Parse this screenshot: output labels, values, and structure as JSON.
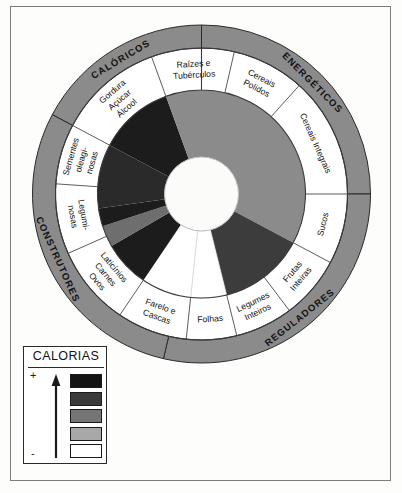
{
  "figure": {
    "center_hole": "empty",
    "outer_ring_color": "#8b8b8b",
    "label_ring_color": "#ffffff",
    "outline_color": "#1a1a1a"
  },
  "categories": [
    {
      "name": "CALORICOS",
      "label": "CALÓRICOS",
      "start_deg": -62,
      "end_deg": 0
    },
    {
      "name": "ENERGETICOS",
      "label": "ENERGÉTICOS",
      "start_deg": 0,
      "end_deg": 90
    },
    {
      "name": "REGULADORES",
      "label": "REGULADORES",
      "start_deg": 90,
      "end_deg": 193
    },
    {
      "name": "CONSTRUTORES",
      "label": "CONSTRUTORES",
      "start_deg": 193,
      "end_deg": 298
    }
  ],
  "food_groups": [
    {
      "name": "gordura-acucar-alcool",
      "lines": [
        "Gordura",
        "Açúcar",
        "Álcool"
      ],
      "start_deg": -62,
      "end_deg": -20
    },
    {
      "name": "raizes-e-tuberculos",
      "lines": [
        "Raízes e",
        "Tubérculos"
      ],
      "start_deg": -20,
      "end_deg": 13
    },
    {
      "name": "cereais-polidos",
      "lines": [
        "Cereais",
        "Polidos"
      ],
      "start_deg": 13,
      "end_deg": 42
    },
    {
      "name": "cereais-integrais",
      "lines": [
        "Cereais Integrais"
      ],
      "start_deg": 42,
      "end_deg": 90
    },
    {
      "name": "sucos",
      "lines": [
        "Sucos"
      ],
      "start_deg": 90,
      "end_deg": 118
    },
    {
      "name": "frutas-inteiras",
      "lines": [
        "Frutas",
        "Inteiras"
      ],
      "start_deg": 118,
      "end_deg": 143
    },
    {
      "name": "legumes-inteiros",
      "lines": [
        "Legumes",
        "Inteiros"
      ],
      "start_deg": 143,
      "end_deg": 166
    },
    {
      "name": "folhas",
      "lines": [
        "Folhas"
      ],
      "start_deg": 166,
      "end_deg": 186
    },
    {
      "name": "farelo-e-cascas",
      "lines": [
        "Farelo e",
        "Cascas"
      ],
      "start_deg": 186,
      "end_deg": 214
    },
    {
      "name": "laticinios-carnes-ovos",
      "lines": [
        "Laticínios",
        "Carnes",
        "Ovos"
      ],
      "start_deg": 214,
      "end_deg": 246
    },
    {
      "name": "leguminosas",
      "lines": [
        "Legumi-",
        "nosas"
      ],
      "start_deg": 246,
      "end_deg": 274
    },
    {
      "name": "sementes-oleaginosas",
      "lines": [
        "Sementes",
        "oleagi-",
        "nosas"
      ],
      "start_deg": 274,
      "end_deg": 298
    }
  ],
  "calorie_segments": [
    {
      "name": "seg-gordura-acucar-alcool",
      "start_deg": -62,
      "end_deg": -20,
      "shade": "#1c1c1c"
    },
    {
      "name": "seg-raizes-cereais",
      "start_deg": -20,
      "end_deg": 90,
      "shade": "#8b8b8b"
    },
    {
      "name": "seg-sucos",
      "start_deg": 90,
      "end_deg": 118,
      "shade": "#8b8b8b"
    },
    {
      "name": "seg-frutas-legumes",
      "start_deg": 118,
      "end_deg": 166,
      "shade": "#3c3c3c"
    },
    {
      "name": "seg-folhas",
      "start_deg": 166,
      "end_deg": 186,
      "shade": "#ffffff"
    },
    {
      "name": "seg-farelo-cascas",
      "start_deg": 186,
      "end_deg": 214,
      "shade": "#ffffff"
    },
    {
      "name": "seg-laticinios",
      "start_deg": 214,
      "end_deg": 240,
      "shade": "#1c1c1c"
    },
    {
      "name": "seg-leguminosas",
      "start_deg": 240,
      "end_deg": 252,
      "shade": "#6e6e6e"
    },
    {
      "name": "seg-sementes",
      "start_deg": 252,
      "end_deg": 262,
      "shade": "#1c1c1c"
    },
    {
      "name": "seg-sementes-b",
      "start_deg": 262,
      "end_deg": 298,
      "shade": "#2a2a2a"
    }
  ],
  "legend": {
    "title": "CALORIAS",
    "high_marker": "+",
    "low_marker": "-",
    "arrow_direction": "up",
    "swatches": [
      {
        "name": "swatch-highest",
        "color": "#141414"
      },
      {
        "name": "swatch-high",
        "color": "#3a3a3a"
      },
      {
        "name": "swatch-medium",
        "color": "#757575"
      },
      {
        "name": "swatch-low",
        "color": "#a8a8a8"
      },
      {
        "name": "swatch-lowest",
        "color": "#ffffff"
      }
    ]
  }
}
